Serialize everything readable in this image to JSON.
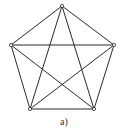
{
  "diagram": {
    "type": "complete-graph",
    "name": "K5",
    "caption": "a)",
    "colors": {
      "edge": "#2a2a2a",
      "vertex_fill": "#ffffff",
      "vertex_stroke": "#2a2a2a",
      "background": "#ffffff"
    },
    "vertices": [
      {
        "id": "top",
        "x": 62,
        "y": 6
      },
      {
        "id": "left",
        "x": 11,
        "y": 45
      },
      {
        "id": "right",
        "x": 114,
        "y": 45
      },
      {
        "id": "bottom-left",
        "x": 30,
        "y": 109
      },
      {
        "id": "bottom-right",
        "x": 94,
        "y": 109
      }
    ],
    "edges": [
      [
        "top",
        "left"
      ],
      [
        "top",
        "right"
      ],
      [
        "top",
        "bottom-left"
      ],
      [
        "top",
        "bottom-right"
      ],
      [
        "left",
        "right"
      ],
      [
        "left",
        "bottom-left"
      ],
      [
        "left",
        "bottom-right"
      ],
      [
        "right",
        "bottom-left"
      ],
      [
        "right",
        "bottom-right"
      ],
      [
        "bottom-left",
        "bottom-right"
      ]
    ]
  }
}
